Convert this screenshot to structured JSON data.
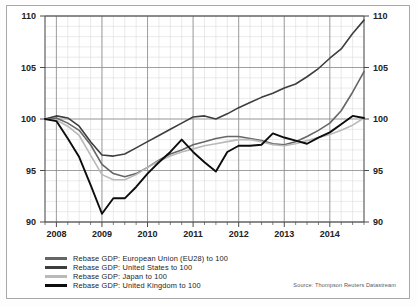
{
  "figure": {
    "background": "#ffffff",
    "frame_color": "#a8a8a8"
  },
  "source": {
    "text": "Source: Thompson Reuters Datastream"
  },
  "legend": {
    "items": [
      {
        "label": "Rebase GDP: European Union (EU28) to 100",
        "color": "#666666",
        "swatch_name": "legend-swatch-eu"
      },
      {
        "label": "Rebase GDP: United States to 100",
        "color": "#3d3d3d",
        "swatch_name": "legend-swatch-us"
      },
      {
        "label": "Rebase GDP: Japan to 100",
        "color": "#b9b9b9",
        "swatch_name": "legend-swatch-japan"
      },
      {
        "label": "Rebase GDP: United Kingdom to 100",
        "color": "#0d0d0d",
        "swatch_name": "legend-swatch-uk"
      }
    ]
  },
  "axes": {
    "y_ticks": [
      "90",
      "95",
      "100",
      "105",
      "110"
    ],
    "y_tick_values": [
      90,
      95,
      100,
      105,
      110
    ],
    "x_ticks": [
      "2008",
      "2009",
      "2010",
      "2011",
      "2012",
      "2013",
      "2014"
    ],
    "x_tick_values": [
      2008,
      2009,
      2010,
      2011,
      2012,
      2013,
      2014
    ]
  },
  "chart_data": {
    "type": "line",
    "title": "",
    "subtitle": "",
    "xlabel": "",
    "ylabel": "",
    "xlim": [
      2007.75,
      2014.75
    ],
    "ylim": [
      90,
      110
    ],
    "grid": true,
    "grid_minor_y_step": 1,
    "grid_major_y_step": 5,
    "grid_major_x_step": 1,
    "grid_minor_x_step": 0.25,
    "legend_position": "below-left",
    "x_unit": "quarter",
    "x": [
      2007.75,
      2008.0,
      2008.25,
      2008.5,
      2008.75,
      2009.0,
      2009.25,
      2009.5,
      2009.75,
      2010.0,
      2010.25,
      2010.5,
      2010.75,
      2011.0,
      2011.25,
      2011.5,
      2011.75,
      2012.0,
      2012.25,
      2012.5,
      2012.75,
      2013.0,
      2013.25,
      2013.5,
      2013.75,
      2014.0,
      2014.25,
      2014.5,
      2014.75
    ],
    "series": [
      {
        "name": "Rebase GDP: European Union (EU28) to 100",
        "color": "#666666",
        "values": [
          100.0,
          100.1,
          99.6,
          98.9,
          97.5,
          95.6,
          94.7,
          94.4,
          94.7,
          95.3,
          96.0,
          96.6,
          97.0,
          97.5,
          97.8,
          98.1,
          98.3,
          98.3,
          98.1,
          97.9,
          97.6,
          97.5,
          97.8,
          98.3,
          98.9,
          99.6,
          100.8,
          102.6,
          104.6
        ]
      },
      {
        "name": "Rebase GDP: United States to 100",
        "color": "#3d3d3d",
        "values": [
          100.0,
          100.3,
          100.1,
          99.3,
          97.8,
          96.5,
          96.4,
          96.6,
          97.2,
          97.8,
          98.4,
          99.0,
          99.6,
          100.2,
          100.3,
          100.0,
          100.5,
          101.1,
          101.6,
          102.1,
          102.5,
          103.0,
          103.4,
          104.1,
          104.9,
          105.9,
          106.8,
          108.3,
          109.6
        ]
      },
      {
        "name": "Rebase GDP: Japan to 100",
        "color": "#b9b9b9",
        "values": [
          100.0,
          99.9,
          99.3,
          98.4,
          96.5,
          94.6,
          94.1,
          94.1,
          94.6,
          95.3,
          95.9,
          96.4,
          96.8,
          97.1,
          97.4,
          97.6,
          97.8,
          98.0,
          98.0,
          97.8,
          97.5,
          97.4,
          97.6,
          97.9,
          98.2,
          98.5,
          98.9,
          99.4,
          100.1
        ]
      },
      {
        "name": "Rebase GDP: United Kingdom to 100",
        "color": "#0d0d0d",
        "values": [
          100.0,
          99.8,
          98.1,
          96.3,
          93.6,
          90.8,
          92.3,
          92.3,
          93.4,
          94.7,
          95.8,
          96.8,
          98.0,
          96.8,
          95.8,
          94.9,
          96.8,
          97.4,
          97.4,
          97.5,
          98.6,
          98.2,
          97.9,
          97.6,
          98.2,
          98.7,
          99.5,
          100.3,
          100.1
        ]
      }
    ]
  }
}
